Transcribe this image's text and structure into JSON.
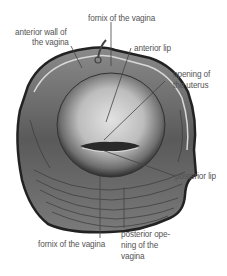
{
  "diagram": {
    "labels": {
      "fornix_top": "fornix of the vagina",
      "anterior_wall_1": "anterior wall of",
      "anterior_wall_2": "the vagina",
      "anterior_lip": "anterior lip",
      "opening_uterus_1": "opening of",
      "opening_uterus_2": "the uterus",
      "posterior_lip": "posterior lip",
      "fornix_bottom": "fornix of the vagina",
      "posterior_opening_1": "posterior ope-",
      "posterior_opening_2": "ning of the",
      "posterior_opening_3": "vagina"
    },
    "colors": {
      "background": "#ffffff",
      "label_text": "#555555",
      "leader_line": "#444444",
      "tissue_dark": "#3a3a3a",
      "tissue_light": "#c8c8c8"
    }
  }
}
